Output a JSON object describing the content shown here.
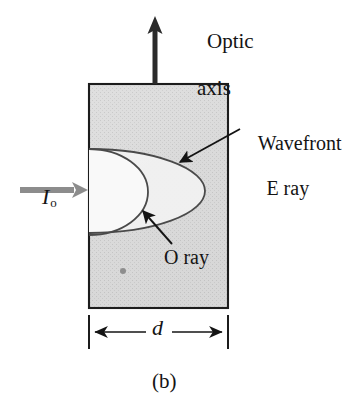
{
  "figure": {
    "caption": "(b)",
    "background_color": "#ffffff",
    "ink_color": "#141414",
    "crystal_fill_color": "#d8d8d8",
    "incident_arrow_color": "#8c8c8c",
    "curve_color": "#4a4a4a"
  },
  "labels": {
    "optic_axis_line1": "Optic",
    "optic_axis_line2": "axis",
    "wavefront_line1": "Wavefront",
    "wavefront_line2": "E ray",
    "o_ray": "O ray",
    "incident_intensity": "I",
    "incident_intensity_sub": "o",
    "thickness": "d"
  },
  "geometry": {
    "crystal_block": {
      "x": 89,
      "y": 84,
      "width": 139,
      "height": 224
    },
    "optic_axis_arrow": {
      "x": 155,
      "y_top": 18,
      "y_bottom": 84
    },
    "incident_arrow": {
      "x_start": 20,
      "x_end": 88,
      "y": 190
    },
    "e_wavefront_ellipse": {
      "cx": 89,
      "cy": 191,
      "rx": 116,
      "ry": 42
    },
    "o_wavefront_circle": {
      "cx": 89,
      "cy": 192,
      "rx": 59,
      "ry": 43
    },
    "point_source_dot": {
      "cx": 123,
      "cy": 271,
      "r": 3
    },
    "dimension_line": {
      "x1": 89,
      "x2": 228,
      "y": 332,
      "tick_top": 315,
      "tick_bottom": 349
    }
  }
}
